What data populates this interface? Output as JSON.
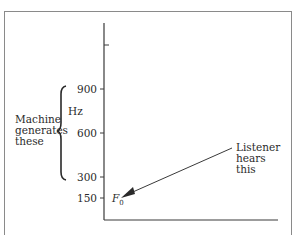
{
  "diagram": {
    "y_axis": {
      "unit": "Hz",
      "ticks": [
        {
          "label": "",
          "y": 45
        },
        {
          "label": "900",
          "y": 89
        },
        {
          "label": "600",
          "y": 133
        },
        {
          "label": "300",
          "y": 177
        },
        {
          "label": "150",
          "y": 198
        }
      ]
    },
    "fundamental_label": "F",
    "fundamental_subscript": "0",
    "brace_label": [
      "Machine",
      "generates",
      "these"
    ],
    "arrow_label": [
      "Listener",
      "hears",
      "this"
    ],
    "colors": {
      "line": "#3a3a3a",
      "frame": "#8a8a8a"
    }
  }
}
